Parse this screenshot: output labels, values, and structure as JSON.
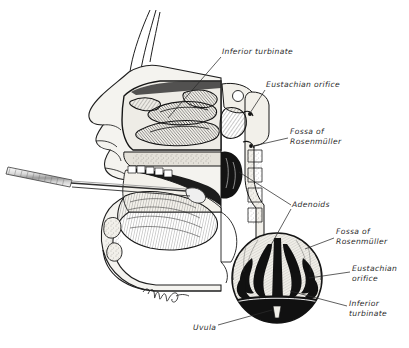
{
  "figure": {
    "background_color": "#ffffff",
    "ink_color": "#1a1a1a",
    "tissue_fill": "#e8e6e0",
    "signature": "Mudge"
  },
  "labels": [
    {
      "id": "inferior-turbinate-main",
      "text": "Inferior turbinate",
      "lines": [
        "Inferior turbinate"
      ],
      "x": 222,
      "y": 51,
      "anchor": "start"
    },
    {
      "id": "eustachian-orifice-main",
      "text": "Eustachian orifice",
      "lines": [
        "Eustachian orifice"
      ],
      "x": 266,
      "y": 84,
      "anchor": "start"
    },
    {
      "id": "fossa-of-rosenmuller-main",
      "text": "Fossa of Rosenmüller",
      "lines": [
        "Fossa of",
        "Rosenmüller"
      ],
      "x": 290,
      "y": 131,
      "anchor": "start"
    },
    {
      "id": "adenoids",
      "text": "Adenoids",
      "lines": [
        "Adenoids"
      ],
      "x": 292,
      "y": 204,
      "anchor": "start"
    },
    {
      "id": "fossa-of-rosenmuller-inset",
      "text": "Fossa of Rosenmüller",
      "lines": [
        "Fossa of",
        "Rosenmüller"
      ],
      "x": 336,
      "y": 231,
      "anchor": "start"
    },
    {
      "id": "eustachian-orifice-inset",
      "text": "Eustachian orifice",
      "lines": [
        "Eustachian",
        "orifice"
      ],
      "x": 352,
      "y": 268,
      "anchor": "start"
    },
    {
      "id": "inferior-turbinate-inset",
      "text": "Inferior turbinate",
      "lines": [
        "Inferior",
        "turbinate"
      ],
      "x": 349,
      "y": 303,
      "anchor": "start"
    },
    {
      "id": "uvula",
      "text": "Uvula",
      "lines": [
        "Uvula"
      ],
      "x": 193,
      "y": 327,
      "anchor": "start"
    }
  ],
  "leader_lines": [
    {
      "id": "leader-inferior-turbinate-main",
      "from": [
        221,
        57
      ],
      "to": [
        168,
        118
      ]
    },
    {
      "id": "leader-eustachian-orifice-main",
      "from": [
        265,
        90
      ],
      "to": [
        250,
        113
      ]
    },
    {
      "id": "leader-fossa-rosenmuller-main",
      "from": [
        288,
        138
      ],
      "to": [
        253,
        146
      ]
    },
    {
      "id": "leader-adenoids-upper",
      "from": [
        291,
        205
      ],
      "to": [
        239,
        172
      ]
    },
    {
      "id": "leader-adenoids-lower",
      "from": [
        291,
        209
      ],
      "to": [
        271,
        245
      ]
    },
    {
      "id": "leader-fossa-rosenmuller-inset",
      "from": [
        334,
        238
      ],
      "to": [
        305,
        249
      ]
    },
    {
      "id": "leader-eustachian-orifice-inset",
      "from": [
        350,
        272
      ],
      "to": [
        309,
        278
      ]
    },
    {
      "id": "leader-inferior-turbinate-inset",
      "from": [
        347,
        306
      ],
      "to": [
        290,
        291
      ]
    },
    {
      "id": "leader-uvula",
      "from": [
        218,
        325
      ],
      "to": [
        272,
        310
      ]
    }
  ],
  "regions": [
    {
      "id": "main-sagittal-section",
      "name": "sagittal section of head",
      "cx": 170,
      "cy": 175
    },
    {
      "id": "mirror-instrument",
      "name": "postnasal mirror",
      "cx": 50,
      "cy": 178
    },
    {
      "id": "circular-inset",
      "name": "mirror view of nasopharynx",
      "cx": 277,
      "cy": 278,
      "r": 45
    }
  ]
}
